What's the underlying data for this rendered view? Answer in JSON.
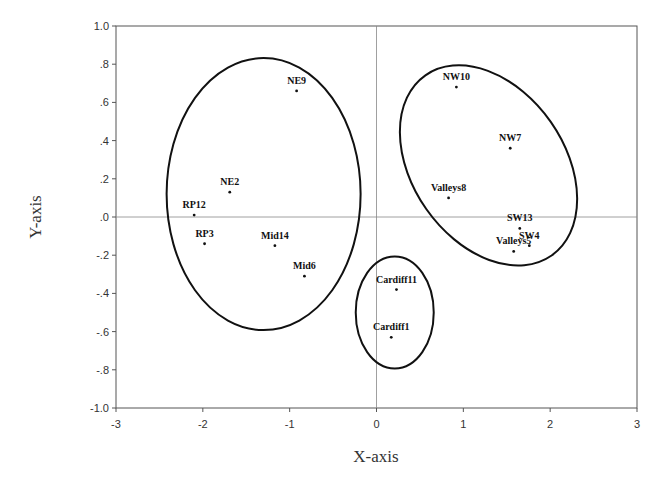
{
  "chart_data": {
    "type": "scatter",
    "title": "",
    "xlabel": "X-axis",
    "ylabel": "Y-axis",
    "xlim": [
      -3,
      3
    ],
    "ylim": [
      -1.0,
      1.0
    ],
    "grid": false,
    "legend": null,
    "reference_lines": {
      "x": 0,
      "y": 0
    },
    "x_ticks": [
      "-3",
      "-2",
      "-1",
      "0",
      "1",
      "2",
      "3"
    ],
    "y_ticks": [
      "1.0",
      ".8",
      ".6",
      ".4",
      ".2",
      ".0",
      "-.2",
      "-.4",
      "-.6",
      "-.8",
      "-1.0"
    ],
    "points": [
      {
        "label": "NE9",
        "x": -0.92,
        "y": 0.66
      },
      {
        "label": "NE2",
        "x": -1.69,
        "y": 0.13
      },
      {
        "label": "RP12",
        "x": -2.1,
        "y": 0.01
      },
      {
        "label": "RP3",
        "x": -1.98,
        "y": -0.14
      },
      {
        "label": "Mid14",
        "x": -1.17,
        "y": -0.15
      },
      {
        "label": "Mid6",
        "x": -0.83,
        "y": -0.31
      },
      {
        "label": "Cardiff11",
        "x": 0.23,
        "y": -0.38
      },
      {
        "label": "Cardiff1",
        "x": 0.17,
        "y": -0.63
      },
      {
        "label": "NW10",
        "x": 0.92,
        "y": 0.68
      },
      {
        "label": "NW7",
        "x": 1.54,
        "y": 0.36
      },
      {
        "label": "Valleys8",
        "x": 0.83,
        "y": 0.1
      },
      {
        "label": "SW13",
        "x": 1.65,
        "y": -0.06
      },
      {
        "label": "SW4",
        "x": 1.76,
        "y": -0.15
      },
      {
        "label": "Valleys5",
        "x": 1.58,
        "y": -0.18
      }
    ],
    "clusters": [
      {
        "name": "left-cluster",
        "members": [
          "NE9",
          "NE2",
          "RP12",
          "RP3",
          "Mid14",
          "Mid6"
        ],
        "cx": -1.3,
        "cy": 0.12,
        "rx": 1.12,
        "ry": 0.71,
        "rotation": 0
      },
      {
        "name": "cardiff-cluster",
        "members": [
          "Cardiff11",
          "Cardiff1"
        ],
        "cx": 0.21,
        "cy": -0.5,
        "rx": 0.45,
        "ry": 0.29,
        "rotation": 0
      },
      {
        "name": "right-cluster",
        "members": [
          "NW10",
          "NW7",
          "Valleys8",
          "SW13",
          "SW4",
          "Valleys5"
        ],
        "cx": 1.29,
        "cy": 0.27,
        "rx": 1.1,
        "ry": 0.55,
        "rotation": 55
      }
    ]
  }
}
